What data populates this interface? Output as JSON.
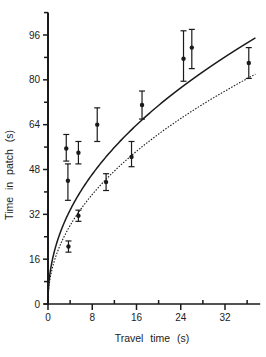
{
  "chart_data": {
    "type": "scatter",
    "title": "",
    "xlabel": "Travel time (s)",
    "ylabel": "Time in patch (s)",
    "xlim": [
      0,
      38
    ],
    "ylim": [
      0,
      104
    ],
    "x_ticks": [
      0,
      8,
      16,
      24,
      32
    ],
    "x_minor_ticks": [
      4,
      12,
      20,
      28,
      36
    ],
    "y_ticks": [
      0,
      16,
      32,
      48,
      64,
      80,
      96
    ],
    "y_minor_ticks": [
      8,
      24,
      40,
      56,
      72,
      88,
      104
    ],
    "grid": false,
    "legend": null,
    "series": [
      {
        "name": "observed",
        "kind": "points_with_error_bars",
        "points": [
          {
            "x": 3.3,
            "y": 55.5,
            "lo": 51,
            "hi": 60.5
          },
          {
            "x": 3.6,
            "y": 44,
            "lo": 37,
            "hi": 50
          },
          {
            "x": 3.7,
            "y": 20.5,
            "lo": 18.5,
            "hi": 22.5
          },
          {
            "x": 5.5,
            "y": 54,
            "lo": 50,
            "hi": 58
          },
          {
            "x": 5.5,
            "y": 31.5,
            "lo": 29.5,
            "hi": 33.5
          },
          {
            "x": 8.9,
            "y": 64,
            "lo": 58,
            "hi": 70
          },
          {
            "x": 10.5,
            "y": 43.5,
            "lo": 40.5,
            "hi": 46.5
          },
          {
            "x": 15.1,
            "y": 52.5,
            "lo": 49,
            "hi": 58
          },
          {
            "x": 17,
            "y": 71,
            "lo": 66,
            "hi": 76
          },
          {
            "x": 24.5,
            "y": 87.5,
            "lo": 79.5,
            "hi": 97.5
          },
          {
            "x": 26,
            "y": 91.5,
            "lo": 84,
            "hi": 98
          },
          {
            "x": 36.3,
            "y": 86,
            "lo": 80.5,
            "hi": 91.5
          }
        ]
      },
      {
        "name": "model-solid",
        "kind": "line",
        "style": "solid",
        "formula": "y = 17.6 * x^0.465",
        "x": [
          0,
          1,
          2,
          4,
          8,
          12,
          16,
          20,
          24,
          28,
          32,
          37.5
        ],
        "y": [
          0,
          17.6,
          24.3,
          33.6,
          46.4,
          55.8,
          64.1,
          71.1,
          77.2,
          83.0,
          88.3,
          95.0
        ]
      },
      {
        "name": "model-dotted",
        "kind": "line",
        "style": "dotted",
        "formula": "y = 14.4 * x^0.48",
        "x": [
          0,
          1,
          2,
          4,
          8,
          12,
          16,
          20,
          24,
          28,
          32,
          37.5
        ],
        "y": [
          0,
          14.4,
          20.1,
          28.0,
          39.0,
          47.3,
          54.3,
          60.4,
          65.8,
          70.8,
          75.5,
          81.5
        ]
      }
    ]
  },
  "axes": {
    "x_title": "Travel time (s)",
    "y_title": "Time in patch (s)"
  },
  "colors": {
    "ink": "#1a1a1a",
    "background": "#ffffff"
  }
}
